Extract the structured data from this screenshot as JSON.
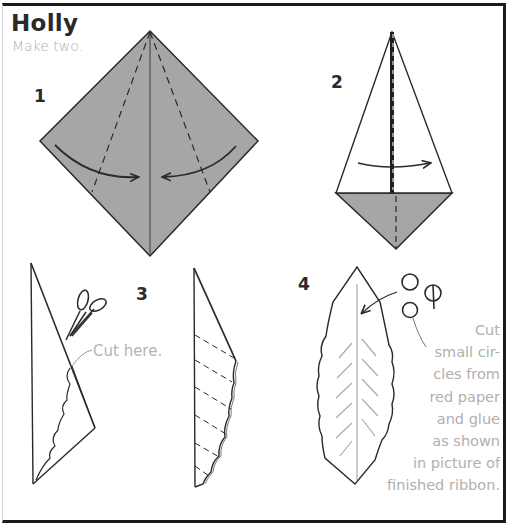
{
  "header": {
    "title": "Holly",
    "subtitle": "Make two."
  },
  "steps": [
    {
      "number": "1"
    },
    {
      "number": "2"
    },
    {
      "number": "3"
    },
    {
      "number": "4"
    }
  ],
  "step3": {
    "cut_label": "Cut  here."
  },
  "step4": {
    "note_lines": [
      "Cut",
      "small cir-",
      "cles from",
      "red paper",
      "and glue",
      "as shown",
      "in picture of",
      "finished ribbon."
    ]
  },
  "colors": {
    "paper_fill": "#a6a6a6",
    "line": "#2a2a2a",
    "light_text": "#b0b0b0"
  }
}
